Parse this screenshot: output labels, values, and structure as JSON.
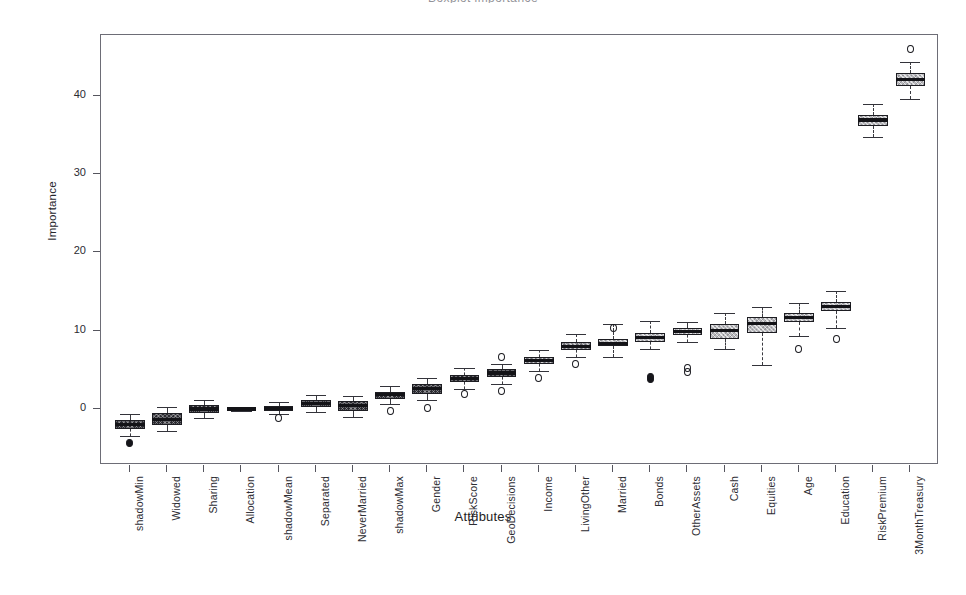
{
  "chart_title": "Boxplot importance",
  "axes": {
    "y_label": "Importance",
    "x_label": "Attributes",
    "y_ticks": [
      0,
      10,
      20,
      30,
      40
    ],
    "y_min": -5,
    "y_max": 47
  },
  "chart_data": {
    "type": "box",
    "title": "Boxplot importance",
    "xlabel": "Attributes",
    "ylabel": "Importance",
    "ylim": [
      -5,
      47
    ],
    "grid": false,
    "legend": "none",
    "categories": [
      "shadowMin",
      "Widowed",
      "Sharing",
      "Allocation",
      "shadowMean",
      "Separated",
      "NeverMarried",
      "shadowMax",
      "Gender",
      "RiskScore",
      "GeoDecisions",
      "Income",
      "LivingOther",
      "Married",
      "Bonds",
      "OtherAssets",
      "Cash",
      "Equities",
      "Age",
      "Education",
      "RiskPremium",
      "3MonthTreasury"
    ],
    "boxes": [
      {
        "label": "shadowMin",
        "whisker_low": -3.4,
        "q1": -2.6,
        "median": -2.0,
        "q3": -1.4,
        "whisker_high": -0.7,
        "outliers": [
          -4.4
        ],
        "fill": "dark"
      },
      {
        "label": "Widowed",
        "whisker_low": -2.8,
        "q1": -2.1,
        "median": -1.3,
        "q3": -0.5,
        "whisker_high": 0.3,
        "outliers": [],
        "fill": "dark"
      },
      {
        "label": "Sharing",
        "whisker_low": -1.1,
        "q1": -0.5,
        "median": 0.0,
        "q3": 0.5,
        "whisker_high": 1.2,
        "outliers": [],
        "fill": "dark"
      },
      {
        "label": "Allocation",
        "whisker_low": -0.2,
        "q1": -0.1,
        "median": 0.0,
        "q3": 0.1,
        "whisker_high": 0.2,
        "outliers": [],
        "fill": "solid"
      },
      {
        "label": "shadowMean",
        "whisker_low": -0.6,
        "q1": -0.2,
        "median": 0.1,
        "q3": 0.4,
        "whisker_high": 0.9,
        "outliers": [
          -1.2
        ],
        "fill": "dark"
      },
      {
        "label": "Separated",
        "whisker_low": -0.4,
        "q1": 0.2,
        "median": 0.7,
        "q3": 1.2,
        "whisker_high": 1.8,
        "outliers": [],
        "fill": "dark"
      },
      {
        "label": "NeverMarried",
        "whisker_low": -1.0,
        "q1": -0.2,
        "median": 0.4,
        "q3": 1.0,
        "whisker_high": 1.7,
        "outliers": [],
        "fill": "dark"
      },
      {
        "label": "shadowMax",
        "whisker_low": 0.6,
        "q1": 1.3,
        "median": 1.8,
        "q3": 2.2,
        "whisker_high": 2.9,
        "outliers": [
          -0.2
        ],
        "fill": "dark"
      },
      {
        "label": "Gender",
        "whisker_low": 1.1,
        "q1": 1.9,
        "median": 2.6,
        "q3": 3.2,
        "whisker_high": 4.0,
        "outliers": [
          0.1
        ],
        "fill": "dark"
      },
      {
        "label": "RiskScore",
        "whisker_low": 2.6,
        "q1": 3.4,
        "median": 3.9,
        "q3": 4.4,
        "whisker_high": 5.2,
        "outliers": [
          1.9
        ],
        "fill": "dark"
      },
      {
        "label": "GeoDecisions",
        "whisker_low": 3.2,
        "q1": 4.1,
        "median": 4.6,
        "q3": 5.1,
        "whisker_high": 5.8,
        "outliers": [
          6.6,
          2.3
        ],
        "fill": "dark"
      },
      {
        "label": "Income",
        "whisker_low": 4.8,
        "q1": 5.7,
        "median": 6.2,
        "q3": 6.7,
        "whisker_high": 7.5,
        "outliers": [
          3.9
        ],
        "fill": "mid"
      },
      {
        "label": "LivingOther",
        "whisker_low": 6.6,
        "q1": 7.5,
        "median": 8.0,
        "q3": 8.5,
        "whisker_high": 9.6,
        "outliers": [
          5.8
        ],
        "fill": "mid"
      },
      {
        "label": "Married",
        "whisker_low": 6.6,
        "q1": 8.0,
        "median": 8.4,
        "q3": 8.9,
        "whisker_high": 10.8,
        "outliers": [
          10.3
        ],
        "fill": "light"
      },
      {
        "label": "Bonds",
        "whisker_low": 7.6,
        "q1": 8.6,
        "median": 9.1,
        "q3": 9.7,
        "whisker_high": 11.3,
        "outliers": [
          4.1,
          3.8
        ],
        "fill": "light"
      },
      {
        "label": "OtherAssets",
        "whisker_low": 8.5,
        "q1": 9.5,
        "median": 9.9,
        "q3": 10.3,
        "whisker_high": 11.1,
        "outliers": [
          5.2,
          4.7
        ],
        "fill": "light"
      },
      {
        "label": "Cash",
        "whisker_low": 7.6,
        "q1": 9.0,
        "median": 10.0,
        "q3": 10.9,
        "whisker_high": 12.3,
        "outliers": [],
        "fill": "light"
      },
      {
        "label": "Equities",
        "whisker_low": 5.6,
        "q1": 9.7,
        "median": 10.9,
        "q3": 11.8,
        "whisker_high": 13.0,
        "outliers": [],
        "fill": "light"
      },
      {
        "label": "Age",
        "whisker_low": 9.3,
        "q1": 11.1,
        "median": 11.7,
        "q3": 12.3,
        "whisker_high": 13.5,
        "outliers": [
          7.6
        ],
        "fill": "light"
      },
      {
        "label": "Education",
        "whisker_low": 10.4,
        "q1": 12.5,
        "median": 13.1,
        "q3": 13.7,
        "whisker_high": 15.1,
        "outliers": [
          9.0
        ],
        "fill": "light"
      },
      {
        "label": "RiskPremium",
        "whisker_low": 34.7,
        "q1": 36.2,
        "median": 36.9,
        "q3": 37.6,
        "whisker_high": 38.9,
        "outliers": [],
        "fill": "light"
      },
      {
        "label": "3MonthTreasury",
        "whisker_low": 39.6,
        "q1": 41.3,
        "median": 42.1,
        "q3": 42.9,
        "whisker_high": 44.3,
        "outliers": [
          46.0
        ],
        "fill": "light"
      }
    ]
  }
}
